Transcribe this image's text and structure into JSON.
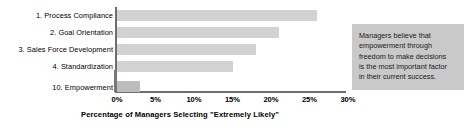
{
  "chart_data": {
    "type": "bar",
    "orientation": "horizontal",
    "title": "",
    "categories": [
      "1. Process Compliance",
      "2. Goal Orientation",
      "3. Sales Force Development",
      "4. Standardization",
      "10. Empowerment"
    ],
    "values": [
      26,
      21,
      18,
      15,
      3
    ],
    "xlabel": "Percentage of Managers Selecting \"Extremely Likely\"",
    "ylabel": "",
    "xlim": [
      0,
      30
    ],
    "xticks": [
      "0%",
      "5%",
      "10%",
      "15%",
      "20%",
      "25%",
      "30%"
    ],
    "xtick_values": [
      0,
      5,
      10,
      15,
      20,
      25,
      30
    ],
    "grid": false,
    "legend": null,
    "bar_color": "#d2d2d2",
    "highlight_bar_color": "#bdbdbd",
    "axis_color": "#6e6e6e",
    "annotations": [
      "Managers believe that empowerment through freedom to make decisions is the most important factor in their current success."
    ]
  },
  "callout": {
    "background": "#c9c9c9",
    "lines": [
      "Managers believe that",
      "empowerment through",
      "freedom to make decisions",
      "is the most important factor",
      "in their current success."
    ]
  }
}
